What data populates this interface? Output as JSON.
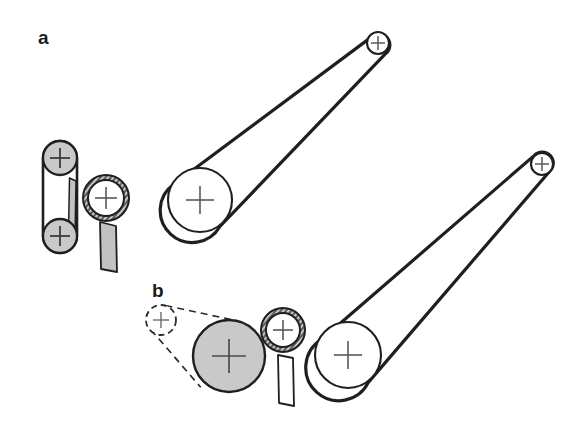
{
  "figure": {
    "width": 582,
    "height": 436,
    "background_color": "#ffffff",
    "stroke_color": "#1f1f1f",
    "gray_fill": "#c9c9c9",
    "hatch_fill": "#6e6e6e",
    "cross_color": "#4a4a4a",
    "panels": [
      {
        "id": "a",
        "label": "a",
        "label_x": 38,
        "label_y": 44,
        "components": [
          {
            "name": "upper-gray-roller",
            "type": "circle",
            "cx": 60,
            "cy": 158,
            "r": 17,
            "fill": "#c9c9c9",
            "marker": "cross"
          },
          {
            "name": "lower-gray-roller",
            "type": "circle",
            "cx": 60,
            "cy": 236,
            "r": 17,
            "fill": "#c9c9c9",
            "marker": "cross"
          },
          {
            "name": "vertical-belt-loop",
            "type": "belt",
            "from": "upper-gray-roller",
            "to": "lower-gray-roller",
            "style": "solid"
          },
          {
            "name": "tension-blade",
            "type": "bar",
            "x": 69,
            "y": 195,
            "w": 7,
            "h": 45,
            "fill": "#c9c9c9"
          },
          {
            "name": "hatched-ring-pulley",
            "type": "ring",
            "cx": 106,
            "cy": 198,
            "r_outer": 24,
            "r_inner": 19,
            "fill": "#ffffff",
            "ring_fill": "#6e6e6e",
            "marker": "cross"
          },
          {
            "name": "support-post",
            "type": "bar",
            "x": 101,
            "y": 222,
            "w": 15,
            "h": 50,
            "fill": "#c9c9c9"
          },
          {
            "name": "large-drive-pulley",
            "type": "circle",
            "cx": 200,
            "cy": 200,
            "r": 32,
            "fill": "#ffffff",
            "marker": "cross"
          },
          {
            "name": "small-idler-pulley",
            "type": "circle",
            "cx": 378,
            "cy": 43,
            "r": 11,
            "fill": "#ffffff",
            "marker": "cross"
          },
          {
            "name": "main-belt-loop",
            "type": "belt",
            "from": "large-drive-pulley",
            "to": "small-idler-pulley",
            "style": "solid"
          }
        ]
      },
      {
        "id": "b",
        "label": "b",
        "label_x": 152,
        "label_y": 297,
        "components": [
          {
            "name": "ghost-idler-pulley",
            "type": "circle",
            "cx": 161,
            "cy": 320,
            "r": 15,
            "fill": "#ffffff",
            "stroke_style": "dashed",
            "marker": "cross"
          },
          {
            "name": "gray-drum",
            "type": "circle",
            "cx": 229,
            "cy": 356,
            "r": 36,
            "fill": "#c9c9c9",
            "marker": "cross"
          },
          {
            "name": "ghost-belt-loop",
            "type": "belt",
            "from": "gray-drum",
            "to": "ghost-idler-pulley",
            "style": "dashed"
          },
          {
            "name": "hatched-ring-pulley",
            "type": "ring",
            "cx": 283,
            "cy": 330,
            "r_outer": 22,
            "r_inner": 17,
            "fill": "#ffffff",
            "ring_fill": "#6e6e6e",
            "marker": "cross"
          },
          {
            "name": "support-post",
            "type": "bar",
            "x": 279,
            "y": 355,
            "w": 14,
            "h": 52,
            "fill": "#ffffff"
          },
          {
            "name": "large-drive-pulley",
            "type": "circle",
            "cx": 348,
            "cy": 355,
            "r": 33,
            "fill": "#ffffff",
            "marker": "cross"
          },
          {
            "name": "small-idler-pulley",
            "type": "circle",
            "cx": 542,
            "cy": 164,
            "r": 11,
            "fill": "#ffffff",
            "marker": "cross"
          },
          {
            "name": "main-belt-loop",
            "type": "belt",
            "from": "large-drive-pulley",
            "to": "small-idler-pulley",
            "style": "solid"
          }
        ]
      }
    ]
  }
}
